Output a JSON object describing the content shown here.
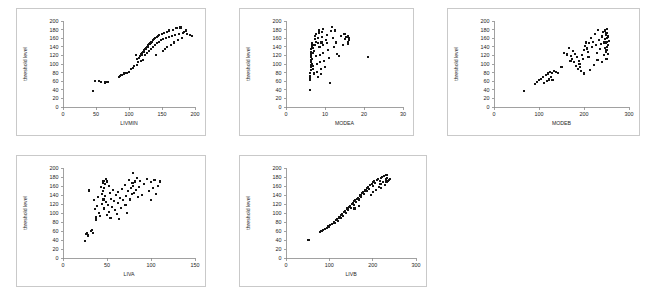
{
  "figure": {
    "background_color": "#ffffff",
    "panel_border_color": "#c9c9c9",
    "marker_color": "#141414",
    "axis_color": "#8a8a8a"
  },
  "chart_data": [
    {
      "type": "scatter",
      "title": "",
      "xlabel": "LIVMIN",
      "ylabel": "threshold level",
      "xlim": [
        0,
        200
      ],
      "ylim": [
        0,
        200
      ],
      "xticks": [
        0,
        50,
        100,
        150,
        200
      ],
      "yticks": [
        0,
        20,
        40,
        60,
        80,
        100,
        120,
        140,
        160,
        180,
        200
      ],
      "grid": false,
      "legend": "none",
      "x": [
        46,
        48,
        55,
        57,
        64,
        66,
        68,
        85,
        87,
        88,
        90,
        92,
        95,
        97,
        100,
        103,
        106,
        108,
        110,
        112,
        112,
        114,
        115,
        116,
        118,
        119,
        120,
        121,
        122,
        123,
        124,
        125,
        126,
        127,
        128,
        129,
        130,
        131,
        132,
        133,
        134,
        135,
        136,
        137,
        138,
        139,
        140,
        141,
        142,
        143,
        144,
        145,
        146,
        148,
        150,
        151,
        152,
        153,
        155,
        156,
        157,
        158,
        160,
        161,
        163,
        165,
        166,
        168,
        170,
        172,
        174,
        176,
        178,
        180,
        182,
        184,
        186,
        188,
        192,
        196
      ],
      "y": [
        38,
        60,
        61,
        58,
        57,
        58,
        59,
        70,
        72,
        74,
        75,
        78,
        79,
        80,
        82,
        88,
        90,
        95,
        120,
        98,
        112,
        105,
        115,
        118,
        108,
        122,
        125,
        110,
        128,
        132,
        120,
        135,
        138,
        126,
        140,
        143,
        130,
        146,
        148,
        135,
        150,
        152,
        140,
        155,
        158,
        145,
        160,
        120,
        163,
        148,
        165,
        152,
        168,
        155,
        170,
        130,
        158,
        172,
        135,
        160,
        175,
        140,
        162,
        178,
        145,
        165,
        180,
        150,
        168,
        183,
        155,
        170,
        185,
        160,
        172,
        175,
        178,
        170,
        168,
        166
      ]
    },
    {
      "type": "scatter",
      "title": "",
      "xlabel": "MODEA",
      "ylabel": "threshold level",
      "xlim": [
        0,
        30
      ],
      "ylim": [
        0,
        200
      ],
      "xticks": [
        0,
        10,
        20,
        30
      ],
      "yticks": [
        0,
        20,
        40,
        60,
        80,
        100,
        120,
        140,
        160,
        180,
        200
      ],
      "grid": false,
      "legend": "none",
      "x": [
        6.1,
        6.1,
        6.2,
        6.2,
        6.2,
        6.3,
        6.3,
        6.3,
        6.4,
        6.4,
        6.4,
        6.5,
        6.5,
        6.5,
        6.6,
        6.6,
        6.6,
        6.7,
        6.7,
        6.8,
        6.8,
        6.9,
        7.0,
        7.1,
        7.2,
        7.3,
        7.4,
        7.5,
        7.6,
        7.7,
        7.8,
        7.9,
        8.0,
        8.1,
        8.2,
        8.3,
        8.4,
        8.5,
        8.6,
        8.7,
        8.8,
        8.9,
        9.0,
        9.1,
        9.2,
        9.3,
        9.4,
        9.5,
        9.6,
        9.8,
        10.0,
        10.2,
        10.4,
        10.6,
        10.8,
        11.0,
        11.2,
        11.5,
        11.8,
        12.0,
        12.2,
        12.5,
        12.8,
        13.0,
        13.5,
        14.0,
        14.5,
        15.0,
        15.2,
        15.5,
        15.8,
        16.0,
        16.0,
        16.1,
        16.2,
        21.0
      ],
      "y": [
        40,
        62,
        68,
        72,
        80,
        86,
        92,
        98,
        104,
        110,
        116,
        122,
        128,
        134,
        140,
        144,
        148,
        100,
        112,
        126,
        138,
        88,
        95,
        78,
        130,
        145,
        158,
        165,
        170,
        152,
        118,
        100,
        82,
        70,
        148,
        160,
        172,
        178,
        140,
        120,
        104,
        88,
        76,
        150,
        162,
        174,
        182,
        144,
        126,
        108,
        92,
        156,
        168,
        148,
        132,
        114,
        56,
        176,
        186,
        160,
        140,
        178,
        150,
        124,
        118,
        166,
        144,
        170,
        158,
        162,
        146,
        164,
        152,
        156,
        160,
        116
      ]
    },
    {
      "type": "scatter",
      "title": "",
      "xlabel": "MODEB",
      "ylabel": "threshold level",
      "xlim": [
        0,
        300
      ],
      "ylim": [
        0,
        200
      ],
      "xticks": [
        0,
        100,
        200,
        300
      ],
      "yticks": [
        0,
        20,
        40,
        60,
        80,
        100,
        120,
        140,
        160,
        180,
        200
      ],
      "grid": false,
      "legend": "none",
      "x": [
        66,
        92,
        96,
        100,
        104,
        108,
        112,
        116,
        118,
        120,
        122,
        124,
        126,
        128,
        130,
        134,
        138,
        142,
        150,
        156,
        162,
        166,
        170,
        172,
        174,
        176,
        178,
        180,
        182,
        184,
        186,
        188,
        190,
        192,
        194,
        196,
        198,
        200,
        200,
        202,
        204,
        206,
        208,
        210,
        212,
        214,
        216,
        218,
        220,
        222,
        224,
        226,
        228,
        230,
        232,
        234,
        236,
        238,
        240,
        240,
        242,
        244,
        244,
        246,
        246,
        246,
        248,
        248,
        248,
        250,
        250,
        250,
        250,
        252,
        252,
        252,
        254,
        254,
        254,
        256
      ],
      "y": [
        38,
        54,
        58,
        62,
        66,
        70,
        56,
        74,
        60,
        78,
        64,
        82,
        70,
        80,
        62,
        84,
        82,
        80,
        94,
        126,
        122,
        138,
        108,
        118,
        112,
        130,
        104,
        124,
        96,
        116,
        88,
        108,
        100,
        92,
        84,
        120,
        112,
        132,
        78,
        142,
        150,
        136,
        128,
        116,
        148,
        86,
        160,
        140,
        152,
        98,
        170,
        144,
        126,
        110,
        180,
        156,
        134,
        146,
        164,
        104,
        174,
        150,
        120,
        138,
        158,
        178,
        128,
        148,
        168,
        112,
        132,
        152,
        172,
        140,
        160,
        182,
        124,
        144,
        164,
        154
      ]
    },
    {
      "type": "scatter",
      "title": "",
      "xlabel": "LIVA",
      "ylabel": "threshold level",
      "xlim": [
        0,
        150
      ],
      "ylim": [
        0,
        200
      ],
      "xticks": [
        0,
        50,
        100,
        150
      ],
      "yticks": [
        0,
        20,
        40,
        60,
        80,
        100,
        120,
        140,
        160,
        180,
        200
      ],
      "grid": false,
      "legend": "none",
      "x": [
        25,
        26,
        27,
        28,
        30,
        32,
        33,
        34,
        35,
        36,
        37,
        38,
        39,
        40,
        41,
        42,
        43,
        44,
        44,
        45,
        45,
        46,
        46,
        47,
        47,
        48,
        48,
        49,
        49,
        50,
        50,
        51,
        52,
        52,
        53,
        54,
        55,
        56,
        57,
        58,
        59,
        60,
        61,
        62,
        63,
        64,
        65,
        66,
        67,
        68,
        70,
        71,
        72,
        73,
        74,
        75,
        76,
        77,
        78,
        79,
        80,
        80,
        81,
        82,
        83,
        84,
        85,
        86,
        88,
        90,
        92,
        95,
        98,
        100,
        100,
        102,
        104,
        106,
        108,
        110
      ],
      "y": [
        38,
        54,
        56,
        50,
        150,
        60,
        62,
        56,
        128,
        108,
        90,
        84,
        116,
        136,
        100,
        94,
        158,
        142,
        120,
        166,
        148,
        172,
        130,
        156,
        110,
        164,
        138,
        176,
        124,
        170,
        96,
        118,
        160,
        102,
        144,
        88,
        132,
        114,
        152,
        126,
        106,
        140,
        98,
        122,
        146,
        86,
        134,
        112,
        154,
        128,
        162,
        118,
        138,
        100,
        148,
        174,
        130,
        156,
        142,
        166,
        188,
        160,
        144,
        170,
        152,
        178,
        136,
        158,
        172,
        140,
        164,
        176,
        148,
        168,
        128,
        156,
        174,
        142,
        160,
        170
      ]
    },
    {
      "type": "scatter",
      "title": "",
      "xlabel": "LIVB",
      "ylabel": "threshold level",
      "xlim": [
        0,
        300
      ],
      "ylim": [
        0,
        200
      ],
      "xticks": [
        0,
        100,
        200,
        300
      ],
      "yticks": [
        0,
        20,
        40,
        60,
        80,
        100,
        120,
        140,
        160,
        180,
        200
      ],
      "grid": false,
      "legend": "none",
      "x": [
        52,
        78,
        82,
        86,
        90,
        94,
        98,
        100,
        102,
        106,
        110,
        112,
        116,
        118,
        120,
        122,
        124,
        126,
        128,
        130,
        132,
        134,
        136,
        138,
        140,
        142,
        144,
        146,
        148,
        150,
        152,
        154,
        156,
        158,
        158,
        160,
        162,
        164,
        166,
        168,
        168,
        170,
        172,
        174,
        176,
        178,
        180,
        182,
        184,
        186,
        188,
        190,
        192,
        194,
        196,
        198,
        200,
        200,
        202,
        204,
        206,
        208,
        210,
        212,
        214,
        216,
        218,
        220,
        220,
        222,
        224,
        226,
        228,
        230,
        232,
        232,
        234,
        236,
        238,
        240
      ],
      "y": [
        40,
        58,
        60,
        62,
        64,
        66,
        70,
        68,
        74,
        76,
        80,
        78,
        84,
        86,
        82,
        90,
        92,
        88,
        96,
        98,
        94,
        102,
        104,
        100,
        108,
        110,
        106,
        114,
        116,
        112,
        120,
        122,
        118,
        126,
        110,
        128,
        124,
        132,
        134,
        130,
        116,
        138,
        140,
        136,
        144,
        146,
        142,
        150,
        152,
        148,
        156,
        158,
        154,
        162,
        140,
        164,
        160,
        146,
        168,
        170,
        166,
        152,
        174,
        176,
        158,
        172,
        164,
        178,
        156,
        180,
        168,
        182,
        162,
        176,
        184,
        170,
        178,
        172,
        174,
        176
      ]
    }
  ]
}
